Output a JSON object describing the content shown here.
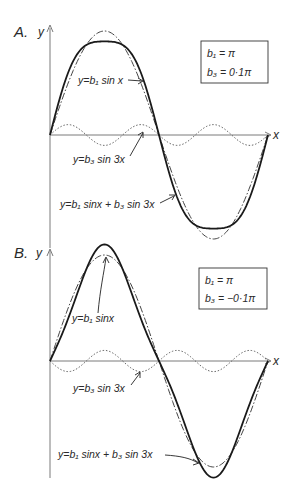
{
  "figure": {
    "panels": [
      {
        "id": "A",
        "letter": "A.",
        "y_axis_label": "y",
        "x_axis_label": "x",
        "params": {
          "b1": "b₁ = π",
          "b3": "b₃ = 0·1π",
          "b1_value": 1.0,
          "b3_value": 0.1
        },
        "labels": {
          "fundamental": "y=b₁ sin x",
          "harmonic": "y=b₃ sin 3x",
          "sum": "y=b₁ sinx + b₃ sin 3x"
        }
      },
      {
        "id": "B",
        "letter": "B.",
        "y_axis_label": "y",
        "x_axis_label": "x",
        "params": {
          "b1": "b₁ = π",
          "b3": "b₃ = −0·1π",
          "b1_value": 1.0,
          "b3_value": -0.1
        },
        "labels": {
          "fundamental": "y=b₁ sinx",
          "harmonic": "y=b₃ sin 3x",
          "sum": "y=b₁ sinx + b₃ sin 3x"
        }
      }
    ],
    "legend": {
      "solid_line": "sum b₁ sin x + b₃ sin 3x",
      "dash_dot_line": "fundamental b₁ sin x",
      "dotted_line": "third harmonic b₃ sin 3x"
    },
    "x_range": [
      "0",
      "2π"
    ],
    "colors": {
      "ink": "#1a1a1a",
      "axis": "#7a7a7a",
      "background": "#ffffff"
    }
  }
}
